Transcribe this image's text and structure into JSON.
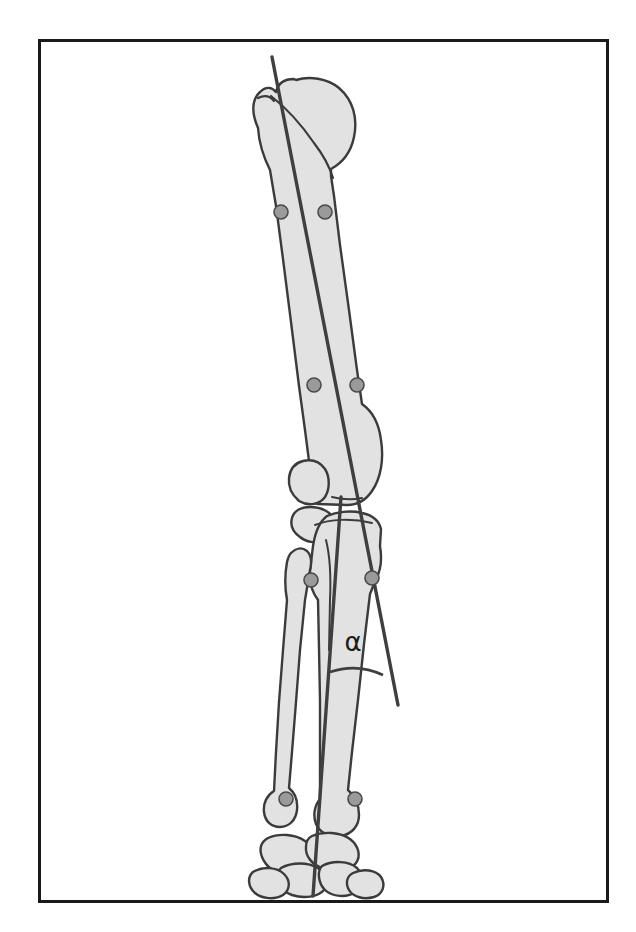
{
  "figure": {
    "title": "Canine hind limb alignment diagram",
    "frame": {
      "border_color": "#1a1a1a",
      "border_width": 3,
      "x": 38,
      "y": 39,
      "width": 570,
      "height": 863,
      "background": "#ffffff"
    },
    "colors": {
      "bone_fill": "#e2e2e2",
      "bone_outline": "#3b3b3b",
      "axis_line": "#3f3f3f",
      "landmark_fill": "#9a9a9a",
      "landmark_stroke": "#4a4a4a",
      "label_color": "#1a1a1a",
      "page_background": "#ffffff"
    },
    "angle": {
      "symbol": "α",
      "label_x": 353,
      "label_y": 651,
      "arc_note": "arc drawn between femoral axis and tibial axis distal to the stifle"
    },
    "axes": [
      {
        "name": "femoral-mechanical-axis",
        "x1": 272,
        "y1": 57,
        "x2": 398,
        "y2": 705,
        "stroke_width": 3.2
      },
      {
        "name": "tibial-mechanical-axis",
        "x1": 341,
        "y1": 497,
        "x2": 313,
        "y2": 896,
        "stroke_width": 3.2
      }
    ],
    "landmarks": [
      {
        "name": "femur-proximal-medial-cortex",
        "cx": 281,
        "cy": 212,
        "r": 7
      },
      {
        "name": "femur-proximal-lateral-cortex",
        "cx": 325,
        "cy": 212,
        "r": 7
      },
      {
        "name": "femur-distal-medial-cortex",
        "cx": 314,
        "cy": 385,
        "r": 7
      },
      {
        "name": "femur-distal-lateral-cortex",
        "cx": 357,
        "cy": 385,
        "r": 7
      },
      {
        "name": "tibia-proximal-medial-cortex",
        "cx": 311,
        "cy": 580,
        "r": 7
      },
      {
        "name": "tibia-proximal-lateral-cortex",
        "cx": 372,
        "cy": 578,
        "r": 7
      },
      {
        "name": "tibia-distal-medial-cortex",
        "cx": 286,
        "cy": 799,
        "r": 7
      },
      {
        "name": "tibia-distal-lateral-cortex",
        "cx": 355,
        "cy": 799,
        "r": 7
      }
    ],
    "bones": [
      {
        "name": "femur",
        "label": "Femur"
      },
      {
        "name": "patella",
        "label": "Patella"
      },
      {
        "name": "fabella-proximal",
        "label": "Fabella"
      },
      {
        "name": "tibia",
        "label": "Tibia"
      },
      {
        "name": "fibula",
        "label": "Fibula"
      },
      {
        "name": "tarsus",
        "label": "Tarsal bones"
      }
    ]
  }
}
